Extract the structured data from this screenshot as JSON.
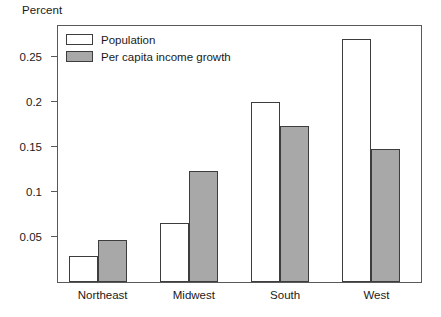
{
  "chart_data": {
    "type": "bar",
    "title": "",
    "ylabel": "Percent",
    "xlabel": "",
    "categories": [
      "Northeast",
      "Midwest",
      "South",
      "West"
    ],
    "series": [
      {
        "name": "Population",
        "values": [
          0.029,
          0.066,
          0.2,
          0.27
        ],
        "color": "#ffffff"
      },
      {
        "name": "Per capita income growth",
        "values": [
          0.047,
          0.124,
          0.173,
          0.148
        ],
        "color": "#a8a8a8"
      }
    ],
    "ylim": [
      0,
      0.287
    ],
    "y_ticks": [
      0.05,
      0.1,
      0.15,
      0.2,
      0.25
    ],
    "y_tick_labels": [
      "0.05",
      "0.1",
      "0.15",
      "0.2",
      "0.25"
    ],
    "grid": false,
    "legend_position": "top-left",
    "bar_edge_color": "#3d3d3d",
    "frame_color": "#595959"
  },
  "legend": {
    "items": [
      {
        "label": "Population"
      },
      {
        "label": "Per capita income growth"
      }
    ]
  }
}
